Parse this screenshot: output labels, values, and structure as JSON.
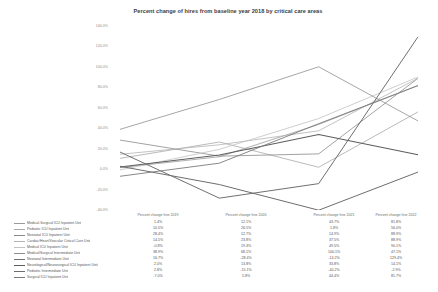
{
  "chart_data": {
    "type": "line",
    "title": "Percent change of hires from baseline year 2018 by critical care areas",
    "xlabel": "",
    "ylabel": "",
    "ylim": [
      -40,
      140
    ],
    "yticks": [
      140,
      120,
      100,
      80,
      60,
      40,
      20,
      0,
      -20,
      -40
    ],
    "ytick_labels": [
      "140.0%",
      "120.0%",
      "100.0%",
      "80.0%",
      "60.0%",
      "40.0%",
      "20.0%",
      "0.0%",
      "-20.0%",
      "-40.0%"
    ],
    "grid": false,
    "legend_position": "below-left",
    "categories": [
      "Percent change hire 2019",
      "Percent change hire 2020",
      "Percent change hire 2021",
      "Percent change hire 2022"
    ],
    "x": [
      "2019",
      "2020",
      "2021",
      "2022"
    ],
    "series": [
      {
        "name": "Medical-Surgical ICU Inpatient Unit",
        "values": [
          1.4,
          12.1,
          43.7,
          81.8
        ],
        "color": "#9a9a9a",
        "width": 0.8
      },
      {
        "name": "Pediatric ICU Inpatient Unit",
        "values": [
          10.5,
          26.5,
          1.8,
          56.0
        ],
        "color": "#a8a8a8",
        "width": 0.8
      },
      {
        "name": "Neonatal ICU Inpatient Unit",
        "values": [
          28.4,
          12.7,
          14.9,
          88.9
        ],
        "color": "#8a8a8a",
        "width": 0.8
      },
      {
        "name": "Cardiac/Heart/Vascular Critical Care Unit",
        "values": [
          14.5,
          23.8,
          37.5,
          88.9
        ],
        "color": "#b4b4b4",
        "width": 0.8
      },
      {
        "name": "Medical ICU Inpatient Unit",
        "values": [
          -0.8,
          19.3,
          49.5,
          90.1
        ],
        "color": "#c2c2c2",
        "width": 0.8
      },
      {
        "name": "Medical/Surgical Intermediate Unit",
        "values": [
          38.9,
          68.1,
          100.1,
          47.1
        ],
        "color": "#8f8f8f",
        "width": 0.8
      },
      {
        "name": "Neonatal Intermediate Unit",
        "values": [
          16.7,
          -28.4,
          -14.2,
          129.4
        ],
        "color": "#707070",
        "width": 1.0
      },
      {
        "name": "Neurological/Neurosurgical ICU Inpatient Unit",
        "values": [
          2.0,
          13.8,
          33.8,
          14.1
        ],
        "color": "#5e5e5e",
        "width": 1.1
      },
      {
        "name": "Pediatric Intermediate Unit",
        "values": [
          2.8,
          -15.1,
          -40.2,
          -2.9
        ],
        "color": "#6d6d6d",
        "width": 1.0
      },
      {
        "name": "Surgical ICU Inpatient Unit",
        "values": [
          -7.0,
          5.8,
          44.4,
          81.7
        ],
        "color": "#7a7a7a",
        "width": 0.9
      }
    ]
  },
  "table": {
    "column_headers": [
      "Percent change hire 2019",
      "Percent change hire 2020",
      "Percent change hire 2021",
      "Percent change hire 2022"
    ],
    "rows": [
      {
        "label": "Medical-Surgical ICU Inpatient Unit",
        "v": [
          "1.4%",
          "12.1%",
          "43.7%",
          "81.8%"
        ]
      },
      {
        "label": "Pediatric ICU Inpatient Unit",
        "v": [
          "10.5%",
          "26.5%",
          "1.8%",
          "56.0%"
        ]
      },
      {
        "label": "Neonatal ICU Inpatient Unit",
        "v": [
          "28.4%",
          "12.7%",
          "14.9%",
          "88.9%"
        ]
      },
      {
        "label": "Cardiac/Heart/Vascular Critical Care Unit",
        "v": [
          "14.5%",
          "23.8%",
          "37.5%",
          "88.9%"
        ]
      },
      {
        "label": "Medical ICU Inpatient Unit",
        "v": [
          "-0.8%",
          "19.3%",
          "49.5%",
          "90.1%"
        ]
      },
      {
        "label": "Medical/Surgical Intermediate Unit",
        "v": [
          "38.9%",
          "68.1%",
          "100.1%",
          "47.1%"
        ]
      },
      {
        "label": "Neonatal Intermediate Unit",
        "v": [
          "16.7%",
          "-28.4%",
          "-14.2%",
          "129.4%"
        ]
      },
      {
        "label": "Neurological/Neurosurgical ICU Inpatient Unit",
        "v": [
          "2.0%",
          "13.8%",
          "33.8%",
          "14.1%"
        ]
      },
      {
        "label": "Pediatric Intermediate Unit",
        "v": [
          "2.8%",
          "-15.1%",
          "-40.2%",
          "-2.9%"
        ]
      },
      {
        "label": "Surgical ICU Inpatient Unit",
        "v": [
          "-7.0%",
          "5.8%",
          "44.4%",
          "81.7%"
        ]
      }
    ]
  }
}
